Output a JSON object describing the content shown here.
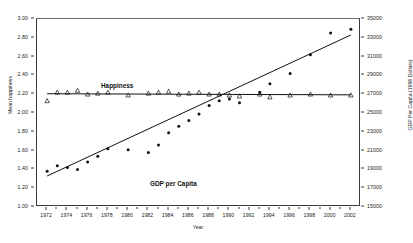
{
  "chart_data": {
    "type": "scatter",
    "title": "",
    "xlabel": "Year",
    "ylabel": "Mean happiness",
    "ylabel_right": "GDP Per Capita (1996 Dollars)",
    "grid": false,
    "legend_position": "inline-annotations",
    "xlim": [
      1971,
      2003
    ],
    "ylim": [
      1.0,
      3.0
    ],
    "ylim_right": [
      15000,
      35000
    ],
    "xticks": [
      1972,
      1974,
      1976,
      1978,
      1980,
      1982,
      1984,
      1986,
      1988,
      1990,
      1992,
      1994,
      1996,
      1998,
      2000,
      2002
    ],
    "xticks_minor": [
      1973,
      1975,
      1977,
      1979,
      1981,
      1983,
      1985,
      1987,
      1989,
      1991,
      1993,
      1995,
      1997,
      1999,
      2001
    ],
    "yticks_left": [
      "1.00",
      "1.20",
      "1.40",
      "1.60",
      "1.80",
      "2.00",
      "2.20",
      "2.40",
      "2.60",
      "2.80",
      "3.00"
    ],
    "yticks_right": [
      "15000",
      "17000",
      "19000",
      "21000",
      "23000",
      "25000",
      "27000",
      "29000",
      "31000",
      "33000",
      "35000"
    ],
    "series": [
      {
        "name": "Happiness",
        "axis": "left",
        "marker": "open-triangle",
        "x": [
          1972,
          1973,
          1974,
          1975,
          1976,
          1977,
          1978,
          1980,
          1982,
          1983,
          1984,
          1985,
          1986,
          1987,
          1988,
          1989,
          1990,
          1991,
          1993,
          1994,
          1996,
          1998,
          2000,
          2002
        ],
        "values": [
          2.13,
          2.22,
          2.22,
          2.24,
          2.2,
          2.21,
          2.22,
          2.19,
          2.21,
          2.22,
          2.23,
          2.2,
          2.21,
          2.22,
          2.2,
          2.2,
          2.19,
          2.18,
          2.2,
          2.17,
          2.19,
          2.2,
          2.19,
          2.19
        ],
        "trend": {
          "x": [
            1972,
            2002
          ],
          "values": [
            2.205,
            2.193
          ]
        }
      },
      {
        "name": "GDP per Capita",
        "axis": "right",
        "marker": "filled-circle",
        "x": [
          1972,
          1973,
          1974,
          1975,
          1976,
          1977,
          1978,
          1980,
          1982,
          1983,
          1984,
          1985,
          1986,
          1987,
          1988,
          1989,
          1990,
          1991,
          1993,
          1994,
          1996,
          1998,
          2000,
          2002
        ],
        "values": [
          18800,
          19400,
          19200,
          19000,
          19800,
          20400,
          21200,
          21100,
          20800,
          21600,
          22900,
          23600,
          24200,
          24900,
          25800,
          26300,
          26500,
          26100,
          27200,
          28100,
          29200,
          31200,
          33500,
          33900
        ],
        "trend": {
          "x": [
            1972,
            2002
          ],
          "values": [
            18300,
            33300
          ]
        }
      }
    ],
    "annotations": [
      {
        "text": "Happiness",
        "x": 1975.5,
        "y": 2.45
      },
      {
        "text": "GDP per Capita",
        "x": 1982.0,
        "y": 1.5
      }
    ],
    "colors": {
      "marker": "#111111",
      "trendline": "#111111",
      "axis": "#3a3a3a"
    }
  }
}
